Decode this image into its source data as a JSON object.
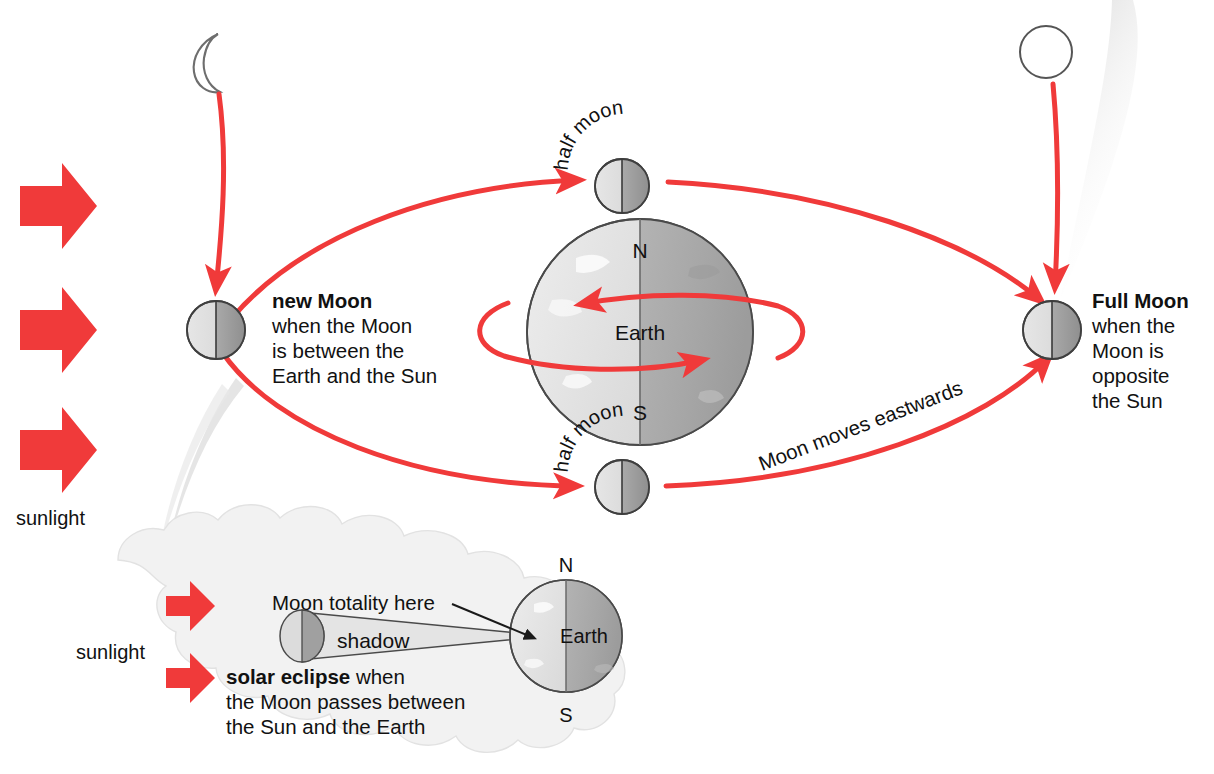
{
  "diagram": {
    "accent_red": "#F03A3A",
    "earth_light": "#d9d9d9",
    "earth_dark": "#a8a8a8",
    "cloud_fill": "#f2f2f2"
  },
  "sunlight": {
    "label_main": "sunlight",
    "label_inset": "sunlight",
    "arrow_count_main": 3,
    "arrow_count_inset": 2,
    "direction": "left-to-right"
  },
  "icons": {
    "crescent": "crescent-moon-icon",
    "disc": "full-moon-disc-icon",
    "block_arrow": "block-arrow-right-icon"
  },
  "orbit": {
    "caption": "Moon moves eastwards",
    "caption_rotation_deg": -21
  },
  "earth": {
    "label": "Earth",
    "north": "N",
    "south": "S",
    "rotation_note": "rotation arrows"
  },
  "phases": [
    {
      "id": "new-moon",
      "title": "new Moon",
      "body": "when the Moon is between the Earth and the Sun",
      "lines": [
        "when the Moon",
        "is between the",
        "Earth and the Sun"
      ]
    },
    {
      "id": "half-moon-top",
      "title": "half moon",
      "body": "",
      "lines": []
    },
    {
      "id": "full-moon",
      "title": "Full Moon",
      "body": "when the Moon is opposite the Sun",
      "lines": [
        "when the",
        "Moon is",
        "opposite",
        "the Sun"
      ]
    },
    {
      "id": "half-moon-bottom",
      "title": "half moon",
      "body": "",
      "lines": []
    }
  ],
  "inset": {
    "totality_label": "Moon totality here",
    "shadow_label": "shadow",
    "eclipse_bold": "solar eclipse",
    "eclipse_rest": " when",
    "eclipse_line2": "the Moon passes between",
    "eclipse_line3": "the Sun and the Earth",
    "earth_label": "Earth",
    "north": "N",
    "south": "S"
  },
  "halfmoon_arc_text": {
    "top": [
      "h",
      "a",
      "l",
      "f",
      " ",
      "m",
      "o",
      "o",
      "n"
    ],
    "bottom": [
      "h",
      "a",
      "l",
      "f",
      " ",
      "m",
      "o",
      "o",
      "n"
    ]
  }
}
